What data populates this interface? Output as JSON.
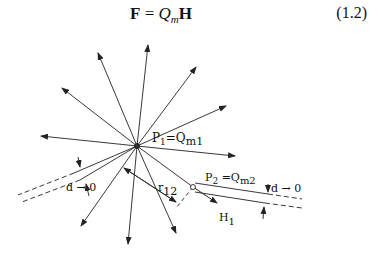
{
  "equation": {
    "lhs": "F",
    "equals": "=",
    "charge_symbol": "Q",
    "charge_subscript": "m",
    "field_symbol": "H",
    "number": "(1.2)"
  },
  "diagram": {
    "pole1_label_main": "P",
    "pole1_label_sub": "1",
    "pole1_label_eq": "=Q",
    "pole1_label_eq_sub": "m1",
    "pole2_label_main": "P",
    "pole2_label_sub": "2",
    "pole2_label_eq": " =Q",
    "pole2_label_eq_sub": "m2",
    "distance_label_main": "r",
    "distance_label_sub": "12",
    "field_label_main": "H",
    "field_label_sub": "1",
    "limit_left": "d → 0",
    "limit_right": "d → 0",
    "line_color": "#222222"
  }
}
